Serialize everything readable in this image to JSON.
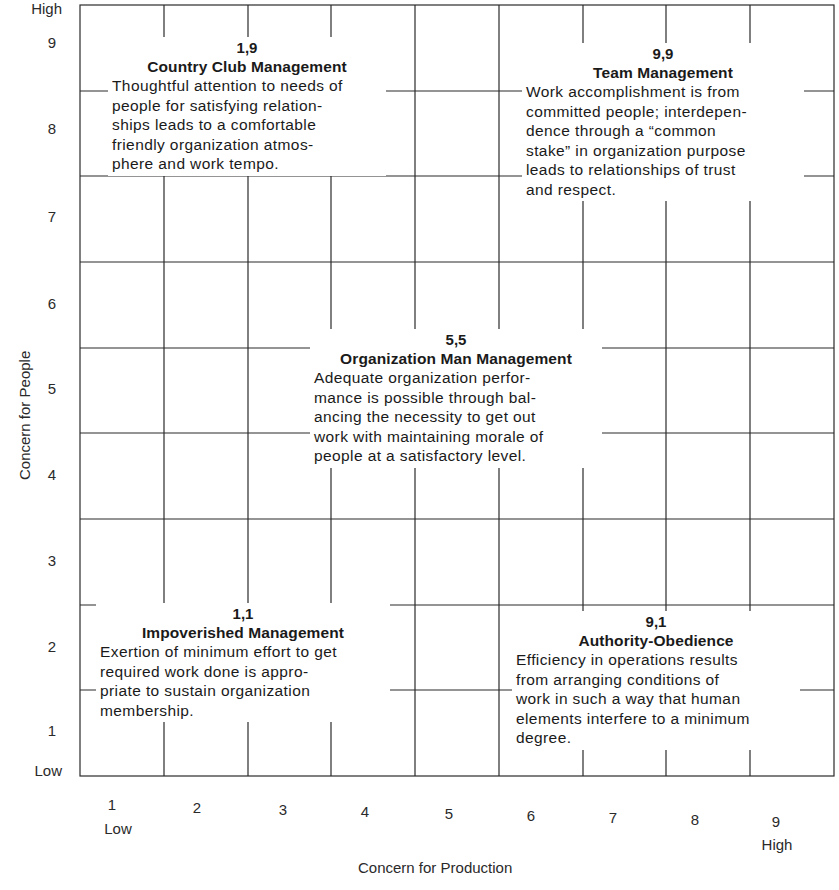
{
  "diagram": {
    "type": "managerial-grid",
    "y_axis": {
      "title": "Concern for People",
      "high_label": "High",
      "low_label": "Low",
      "ticks": [
        "9",
        "8",
        "7",
        "6",
        "5",
        "4",
        "3",
        "2",
        "1"
      ]
    },
    "x_axis": {
      "title": "Concern for Production",
      "high_label": "High",
      "low_label": "Low",
      "ticks": [
        "1",
        "2",
        "3",
        "4",
        "5",
        "6",
        "7",
        "8",
        "9"
      ]
    },
    "styles": {
      "country_club": {
        "coord": "1,9",
        "title": "Country Club Management",
        "lines": [
          "Thoughtful attention to needs of",
          "people for satisfying relation-",
          "ships leads to a comfortable",
          "friendly organization atmos-",
          "phere and work tempo."
        ]
      },
      "team": {
        "coord": "9,9",
        "title": "Team Management",
        "lines": [
          "Work accomplishment is from",
          "committed people; interdepen-",
          "dence through a “common",
          "stake” in organization purpose",
          "leads to relationships of trust",
          "and respect."
        ]
      },
      "organization_man": {
        "coord": "5,5",
        "title": "Organization Man Management",
        "lines": [
          "Adequate organization perfor-",
          "mance is possible through bal-",
          "ancing the necessity to get out",
          "work with maintaining morale of",
          "people at a satisfactory level."
        ]
      },
      "impoverished": {
        "coord": "1,1",
        "title": "Impoverished Management",
        "lines": [
          "Exertion of minimum effort to get",
          "required work done is appro-",
          "priate to sustain organization",
          "membership."
        ]
      },
      "authority_obedience": {
        "coord": "9,1",
        "title": "Authority-Obedience",
        "lines": [
          "Efficiency in operations results",
          "from arranging conditions of",
          "work in such a way that human",
          "elements interfere to a minimum",
          "degree."
        ]
      }
    },
    "colors": {
      "line": "#2b2b2b",
      "text": "#1a1a1a",
      "background": "#ffffff"
    }
  }
}
